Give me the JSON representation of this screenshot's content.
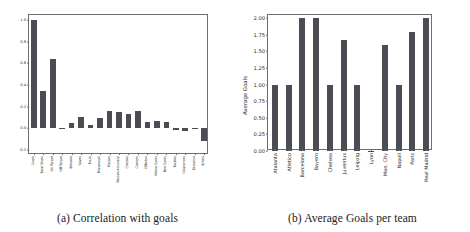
{
  "figure": {
    "panel_a": {
      "caption": "(a) Correlation with goals",
      "bar_color": "#4c4c54"
    },
    "panel_b": {
      "caption": "(b) Average Goals per team",
      "bar_color": "#4c4c54"
    }
  },
  "chart_data": [
    {
      "type": "bar",
      "title": "(a) Correlation with goals",
      "xlabel": "",
      "ylabel": "",
      "ylim": [
        -0.25,
        1.05
      ],
      "yticks": [
        "1.0",
        "0.8",
        "0.6",
        "0.4",
        "0.2",
        "0.0",
        "-0.2"
      ],
      "ytick_values": [
        1.0,
        0.8,
        0.6,
        0.4,
        0.2,
        0.0,
        -0.2
      ],
      "grid": false,
      "legend": "none",
      "categories": [
        "Goals",
        "Total Shots",
        "On Target",
        "Off Target",
        "Blocked",
        "Saves",
        "Fouls",
        "Possession",
        "Passes",
        "Passes Accuracy",
        "Crosses",
        "Corners",
        "Offsides",
        "Yellow Cards",
        "Red Cards",
        "Tackles",
        "Clearances",
        "Distance",
        "Errors"
      ],
      "values": [
        1.0,
        0.34,
        0.64,
        -0.01,
        0.05,
        0.1,
        0.03,
        0.09,
        0.16,
        0.15,
        0.13,
        0.16,
        0.06,
        0.07,
        0.06,
        -0.02,
        -0.03,
        -0.01,
        -0.12
      ]
    },
    {
      "type": "bar",
      "title": "(b) Average Goals per team",
      "xlabel": "",
      "ylabel": "Average Goals",
      "ylim": [
        0.0,
        2.05
      ],
      "yticks": [
        "2.00",
        "1.75",
        "1.50",
        "1.25",
        "1.00",
        "0.75",
        "0.50",
        "0.25",
        "0.00"
      ],
      "ytick_values": [
        2.0,
        1.75,
        1.5,
        1.25,
        1.0,
        0.75,
        0.5,
        0.25,
        0.0
      ],
      "grid": false,
      "legend": "none",
      "categories": [
        "Atalanta",
        "Atletico",
        "Barcelona",
        "Bayern",
        "Chelsea",
        "Juventus",
        "Leipzig",
        "Lyon",
        "Man. City",
        "Napoli",
        "Paris",
        "Real Madrid"
      ],
      "values": [
        1.0,
        1.0,
        2.0,
        2.0,
        1.0,
        1.67,
        1.0,
        0.0,
        1.6,
        1.0,
        1.8,
        2.0
      ]
    }
  ]
}
